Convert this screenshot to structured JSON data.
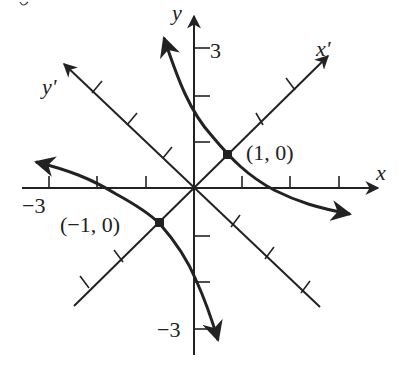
{
  "figure": {
    "type": "rotated-axes-hyperbola",
    "axes": {
      "x_label": "x",
      "y_label": "y",
      "x_prime_label": "x'",
      "y_prime_label": "y'",
      "x_min_label": "−3",
      "y_max_label": "3",
      "y_min_label": "−3"
    },
    "points": [
      {
        "label": "(1, 0)"
      },
      {
        "label": "(−1, 0)"
      }
    ],
    "colors": {
      "ink": "#222222",
      "background": "#ffffff"
    }
  }
}
